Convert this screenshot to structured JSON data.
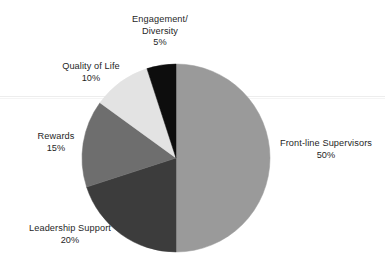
{
  "chart_data": {
    "type": "pie",
    "title": "",
    "subtitle": "",
    "xlabel": "",
    "ylabel": "",
    "legend_position": "none",
    "grid": false,
    "start_angle_deg": 0,
    "direction": "clockwise",
    "total": 100,
    "unit": "%",
    "categories": [
      "Front-line Supervisors",
      "Leadership Support",
      "Rewards",
      "Quality of Life",
      "Engagement/ Diversity"
    ],
    "values": [
      50,
      20,
      15,
      10,
      5
    ],
    "colors": [
      "#9a9a9a",
      "#3c3c3c",
      "#6e6e6e",
      "#e3e3e3",
      "#0d0d0d"
    ],
    "slices": [
      {
        "name": "front-line-supervisors",
        "label": "Front-line Supervisors",
        "value": 50,
        "value_text": "50%",
        "color": "#9a9a9a",
        "start_deg": 0,
        "end_deg": 180
      },
      {
        "name": "leadership-support",
        "label": "Leadership Support",
        "value": 20,
        "value_text": "20%",
        "color": "#3c3c3c",
        "start_deg": 180,
        "end_deg": 252
      },
      {
        "name": "rewards",
        "label": "Rewards",
        "value": 15,
        "value_text": "15%",
        "color": "#6e6e6e",
        "start_deg": 252,
        "end_deg": 306
      },
      {
        "name": "quality-of-life",
        "label": "Quality of Life",
        "value": 10,
        "value_text": "10%",
        "color": "#e3e3e3",
        "start_deg": 306,
        "end_deg": 342
      },
      {
        "name": "engagement-diversity",
        "label_line1": "Engagement/",
        "label_line2": "Diversity",
        "label": "Engagement/ Diversity",
        "value": 5,
        "value_text": "5%",
        "color": "#0d0d0d",
        "start_deg": 342,
        "end_deg": 360
      }
    ],
    "geometry": {
      "center_x": 176,
      "center_y": 158,
      "radius": 94
    }
  },
  "labels": {
    "engagement": {
      "line1": "Engagement/",
      "line2": "Diversity",
      "value": "5%"
    },
    "quality": {
      "line1": "Quality of Life",
      "value": "10%"
    },
    "rewards": {
      "line1": "Rewards",
      "value": "15%"
    },
    "leadership": {
      "line1": "Leadership Support",
      "value": "20%"
    },
    "frontline": {
      "line1": "Front-line Supervisors",
      "value": "50%"
    }
  },
  "canvas": {
    "background": "#ffffff",
    "text_color": "#1f1f1f"
  }
}
